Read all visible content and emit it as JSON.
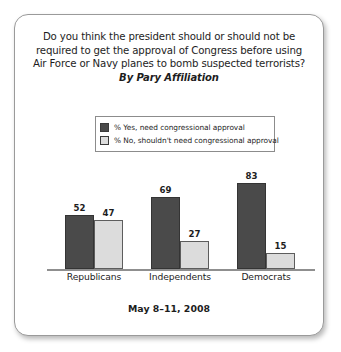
{
  "card": {
    "title_lines": [
      "Do you think the president should or should not be",
      "required to get the approval of Congress before using",
      "Air Force or Navy planes to bomb suspected terrorists?"
    ],
    "subtitle": "By Pary Affiliation",
    "footer": "May 8–11, 2008"
  },
  "legend": {
    "entries": [
      {
        "label": "% Yes, need congressional approval",
        "color": "#4a4a4a"
      },
      {
        "label": "% No, shouldn't need congressional approval",
        "color": "#dcdcdc"
      }
    ]
  },
  "chart_data": {
    "type": "bar",
    "title": "Do you think the president should or should not be required to get the approval of Congress before using Air Force or Navy planes to bomb suspected terrorists?",
    "subtitle": "By Pary Affiliation",
    "categories": [
      "Republicans",
      "Independents",
      "Democrats"
    ],
    "series": [
      {
        "name": "% Yes, need congressional approval",
        "color": "#4a4a4a",
        "values": [
          52,
          69,
          83
        ]
      },
      {
        "name": "% No, shouldn't need congressional approval",
        "color": "#dcdcdc",
        "values": [
          47,
          27,
          15
        ]
      }
    ],
    "xlabel": "",
    "ylabel": "",
    "ylim": [
      0,
      100
    ],
    "grid": false,
    "legend_position": "top",
    "annotation": "May 8–11, 2008"
  }
}
